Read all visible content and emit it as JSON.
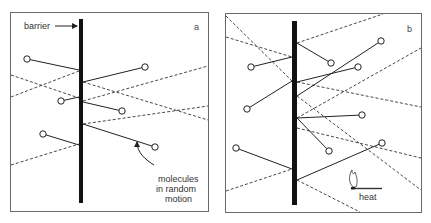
{
  "figure": {
    "panel_a": {
      "letter": "a",
      "labels": {
        "barrier": "barrier",
        "molecules_line1": "molecules",
        "molecules_line2": "in random",
        "molecules_line3": "motion"
      }
    },
    "panel_b": {
      "letter": "b",
      "labels": {
        "heat": "heat"
      }
    }
  },
  "colors": {
    "line": "#222222",
    "barrier": "#111111",
    "frame": "#6a6a6a",
    "background": "#ffffff"
  }
}
